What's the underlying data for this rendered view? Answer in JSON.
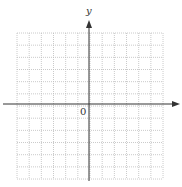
{
  "diagram": {
    "type": "coordinate-plane",
    "axes": {
      "x_label": "",
      "y_label": "y",
      "origin_label": "0"
    },
    "grid": {
      "columns": 12,
      "rows": 12,
      "left": 17,
      "top": 33,
      "cell": 12.17,
      "line_style": "dotted",
      "line_color": "#bdbdbd"
    },
    "axis_color": "#333333",
    "origin_px": {
      "x": 89,
      "y": 104
    }
  }
}
